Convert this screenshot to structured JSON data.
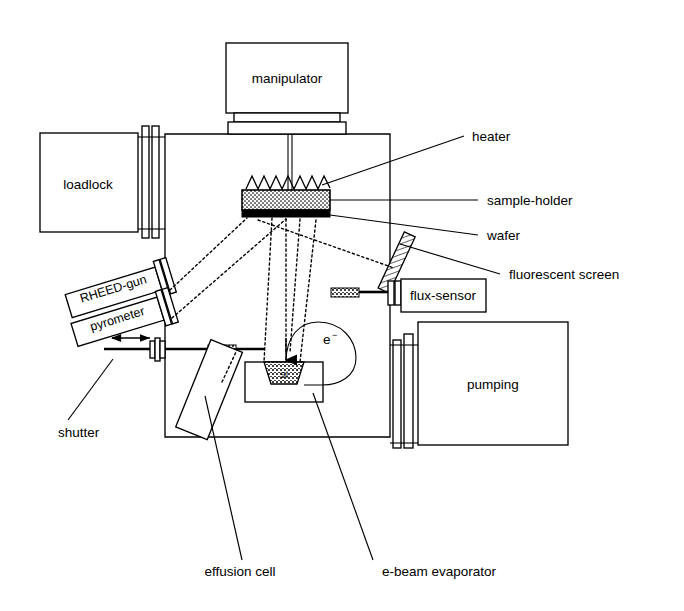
{
  "figure": {
    "kind": "mbe-system-schematic",
    "background": "#ffffff",
    "ink": "#000000"
  },
  "components": {
    "manipulator": "manipulator",
    "loadlock": "loadlock",
    "rheed_gun": "RHEED-gun",
    "pyrometer": "pyrometer",
    "flux_sensor": "flux-sensor",
    "pumping": "pumping",
    "crucible_material": "Si",
    "electron_symbol": "e",
    "electron_charge": "−"
  },
  "callouts": {
    "heater": "heater",
    "sample_holder": "sample-holder",
    "wafer": "wafer",
    "fluorescent_screen": "fluorescent screen",
    "shutter": "shutter",
    "effusion_cell": "effusion cell",
    "ebeam_evaporator": "e-beam evaporator"
  }
}
